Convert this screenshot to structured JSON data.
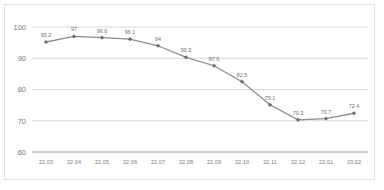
{
  "chart_data": {
    "type": "line",
    "title": "",
    "subtitle": "",
    "xlabel": "",
    "ylabel": "",
    "categories": [
      "22.03",
      "22.04",
      "22.05",
      "22.06",
      "22.07",
      "22.08",
      "22.09",
      "22.10",
      "22.11",
      "22.12",
      "23.01",
      "23.02"
    ],
    "values": [
      95.2,
      97,
      96.6,
      96.1,
      94,
      90.3,
      87.6,
      82.5,
      75.1,
      70.3,
      70.7,
      72.4
    ],
    "data_labels": [
      "95.2",
      "97",
      "96.6",
      "96.1",
      "94",
      "90.3",
      "87.6",
      "82.5",
      "75.1",
      "70.3",
      "70.7",
      "72.4"
    ],
    "ylim": [
      60,
      100
    ],
    "yticks": [
      100,
      90,
      80,
      70,
      60
    ],
    "ytick_labels": [
      "100",
      "90",
      "80",
      "70",
      "60"
    ],
    "grid": true,
    "grid_axis": "y",
    "legend": false,
    "legend_position": "none",
    "series": [
      {
        "name": "",
        "values": [
          95.2,
          97,
          96.6,
          96.1,
          94,
          90.3,
          87.6,
          82.5,
          75.1,
          70.3,
          70.7,
          72.4
        ]
      }
    ],
    "colors": {
      "line": "#8c8c8c",
      "marker": "#6b6b6b",
      "grid": "#d9d9d9",
      "axis": "#9a9a9a",
      "text": "#7a7a7a",
      "frame": "#e2e2e2",
      "background": "#ffffff"
    }
  }
}
